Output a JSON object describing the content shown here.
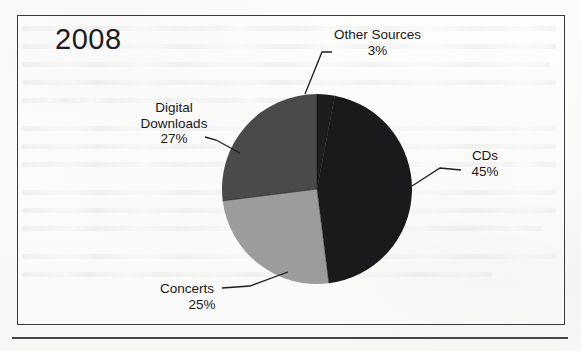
{
  "figure": {
    "title": "2008",
    "frame": true,
    "bottom_rule": true
  },
  "chart_data": {
    "type": "pie",
    "title": "2008",
    "xlabel": "",
    "ylabel": "",
    "legend_position": "none",
    "grid": false,
    "start_angle_deg": 0,
    "direction": "clockwise",
    "categories": [
      "Other Sources",
      "CDs",
      "Concerts",
      "Digital Downloads"
    ],
    "values": [
      3,
      45,
      25,
      27
    ],
    "unit": "%",
    "slices": [
      {
        "label": "Other Sources",
        "value": 3,
        "display_value": "3%",
        "color": "#1d1d1f",
        "start_angle_deg": 0,
        "end_angle_deg": 10.8,
        "leader": true
      },
      {
        "label": "CDs",
        "value": 45,
        "display_value": "45%",
        "color": "#1a1a1c",
        "start_angle_deg": 10.8,
        "end_angle_deg": 172.8,
        "leader": true
      },
      {
        "label": "Concerts",
        "value": 25,
        "display_value": "25%",
        "color": "#9c9c9c",
        "start_angle_deg": 172.8,
        "end_angle_deg": 262.8,
        "leader": true
      },
      {
        "label": "Digital Downloads",
        "value": 27,
        "display_value": "27%",
        "color": "#4a4a4c",
        "start_angle_deg": 262.8,
        "end_angle_deg": 360,
        "leader": true
      }
    ]
  },
  "labels": {
    "other_sources": {
      "name": "Other Sources",
      "percent": "3%"
    },
    "digital_downloads": {
      "line1": "Digital",
      "line2": "Downloads",
      "percent": "27%"
    },
    "cds": {
      "name": "CDs",
      "percent": "45%"
    },
    "concerts": {
      "name": "Concerts",
      "percent": "25%"
    }
  },
  "colors": {
    "cds": "#1a1a1c",
    "other_sources": "#1d1d1f",
    "digital_downloads": "#4a4a4c",
    "concerts": "#9c9c9c",
    "frame": "#3b3b3d",
    "text": "#18181a",
    "background": "#fbfbfa"
  }
}
